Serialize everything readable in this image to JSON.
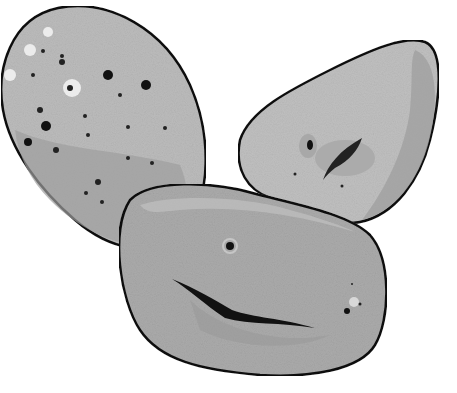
{
  "scene": {
    "width": 457,
    "height": 393,
    "background": "#ffffff",
    "subject": "three potatoes",
    "outline_color": "#111111",
    "potatoes": [
      {
        "name": "left-oval-potato",
        "fill": "#b9b9b9",
        "shade": "#9a9a9a",
        "spots": [
          [
            43,
            51,
            2,
            "#222"
          ],
          [
            62,
            56,
            2,
            "#222"
          ],
          [
            33,
            75,
            2,
            "#222"
          ],
          [
            70,
            88,
            3,
            "#222"
          ],
          [
            108,
            75,
            5,
            "#111"
          ],
          [
            146,
            85,
            5,
            "#111"
          ],
          [
            120,
            95,
            2,
            "#222"
          ],
          [
            40,
            110,
            3,
            "#222"
          ],
          [
            46,
            126,
            5,
            "#111"
          ],
          [
            85,
            116,
            2,
            "#222"
          ],
          [
            28,
            142,
            4,
            "#111"
          ],
          [
            56,
            150,
            3,
            "#222"
          ],
          [
            88,
            135,
            2,
            "#222"
          ],
          [
            128,
            127,
            2,
            "#222"
          ],
          [
            165,
            128,
            2,
            "#222"
          ],
          [
            98,
            182,
            3,
            "#222"
          ],
          [
            86,
            193,
            2,
            "#222"
          ],
          [
            102,
            202,
            2,
            "#222"
          ],
          [
            62,
            62,
            3,
            "#222"
          ],
          [
            128,
            158,
            2,
            "#222"
          ],
          [
            152,
            163,
            2,
            "#222"
          ]
        ],
        "highlights": [
          [
            48,
            32,
            5
          ],
          [
            30,
            50,
            6
          ],
          [
            10,
            75,
            6
          ],
          [
            72,
            88,
            9
          ]
        ]
      },
      {
        "name": "right-wedge-potato",
        "fill": "#bdbdbd",
        "shade": "#a3a3a3"
      },
      {
        "name": "front-potato",
        "fill": "#a9a9a9",
        "shade": "#979797"
      }
    ]
  }
}
